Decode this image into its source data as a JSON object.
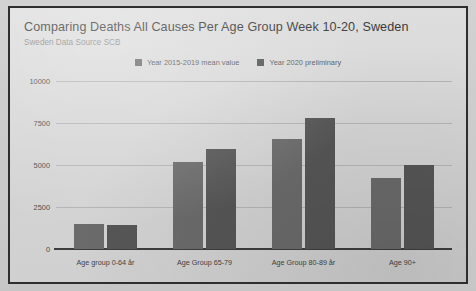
{
  "chart_data": {
    "type": "bar",
    "title": "Comparing Deaths All Causes Per Age Group Week 10-20, Sweden",
    "subtitle": "Sweden Data Source SCB",
    "categories": [
      "Age group 0-64 år",
      "Age Group 65-79",
      "Age Group 80-89 år",
      "Age 90+"
    ],
    "series": [
      {
        "name": "Year 2015-2019 mean value",
        "color": "#6b6b6b",
        "values": [
          1460,
          5180,
          6530,
          4220
        ]
      },
      {
        "name": "Year 2020 preliminary",
        "color": "#565656",
        "values": [
          1400,
          5970,
          7800,
          5030
        ]
      }
    ],
    "xlabel": "",
    "ylabel": "",
    "ylim": [
      0,
      10000
    ],
    "yticks": [
      0,
      2500,
      5000,
      7500,
      10000
    ],
    "ytick_labels": [
      "0",
      "2500",
      "5000",
      "7500",
      "10000"
    ],
    "grid": true,
    "legend_position": "top-center"
  },
  "colors": {
    "series1": "#6b6b6b",
    "series2": "#565656",
    "gridline": "#b5b5b5",
    "axis": "#3d3d3d",
    "title_text": "#3a3a3a",
    "subtitle_text": "#8b8b8b",
    "card_background": "#d8d8d8",
    "frame_border": "#2e2e2e"
  }
}
